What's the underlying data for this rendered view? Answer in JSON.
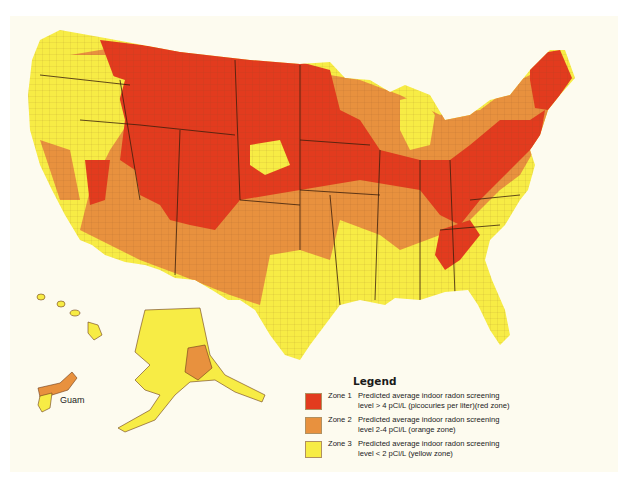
{
  "map": {
    "title": "EPA Map of Radon Zones",
    "colors": {
      "zone1": "#e23b1e",
      "zone2": "#e8913e",
      "zone3": "#f7ec45",
      "background": "#fdfbef",
      "border": "#6b3a1a"
    },
    "labels": {
      "guam": "Guam"
    }
  },
  "legend": {
    "title": "Legend",
    "items": [
      {
        "zone": "Zone 1",
        "line1": "Predicted average indoor radon screening",
        "line2": "level > 4 pCi/L (picocuries per liter)(red zone)",
        "color": "#e23b1e"
      },
      {
        "zone": "Zone 2",
        "line1": "Predicted average indoor radon screening",
        "line2": "level 2-4 pCi/L (orange zone)",
        "color": "#e8913e"
      },
      {
        "zone": "Zone 3",
        "line1": "Predicted average indoor radon screening",
        "line2": "level < 2 pCi/L (yellow zone)",
        "color": "#f7ec45"
      }
    ]
  }
}
